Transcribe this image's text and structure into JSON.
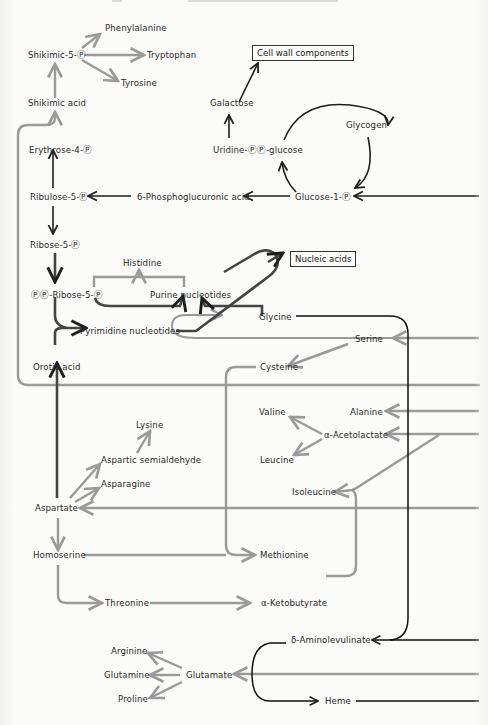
{
  "diagram": {
    "type": "metabolic-pathway",
    "legend_colors": {
      "dark_path": "#1e1e1e",
      "gray_path": "#9a9a9a"
    },
    "boxes": {
      "cell_wall": "Cell wall components",
      "nucleic_acids": "Nucleic acids"
    },
    "nodes": {
      "phenylalanine": "Phenylalanine",
      "shikimic5p": "Shikimic-5-Ⓟ",
      "tryptophan": "Tryptophan",
      "tyrosine": "Tyrosine",
      "shikimic_acid": "Shikimic acid",
      "galactose": "Galactose",
      "glycogen": "Glycogen",
      "erythrose4p": "Erythrose-4-Ⓟ",
      "udp_glucose": "Uridine-ⓅⓅ-glucose",
      "ribulose5p": "Ribulose-5-Ⓟ",
      "phosphogluconic": "6-Phosphoglucuronic acid",
      "glucose1p": "Glucose-1-Ⓟ",
      "ribose5p": "Ribose-5-Ⓟ",
      "histidine": "Histidine",
      "pprpp": "ⓅⓅ-Ribose-5-Ⓟ",
      "purine": "Purine nucleotides",
      "pyrimidine": "Pyrimidine  nucleotides",
      "glycine": "Glycine",
      "serine": "Serine",
      "orotic": "Orotic  acid",
      "cysteine": "Cysteine",
      "valine": "Valine",
      "alanine": "Alanine",
      "acetolactate": "α-Acetolactate",
      "lysine": "Lysine",
      "leucine": "Leucine",
      "aspartic_semi": "Aspartic semialdehyde",
      "asparagine": "Asparagine",
      "isoleucine": "Isoleucine",
      "aspartate": "Aspartate",
      "homoserine": "Homoserine",
      "methionine": "Methionine",
      "threonine": "Threonine",
      "ketobutyrate": "α-Ketobutyrate",
      "aminolevulinate": "δ-Aminolevulinate",
      "arginine": "Arginine",
      "glutamine": "Glutamine",
      "glutamate": "Glutamate",
      "proline": "Proline",
      "heme": "Heme"
    }
  }
}
